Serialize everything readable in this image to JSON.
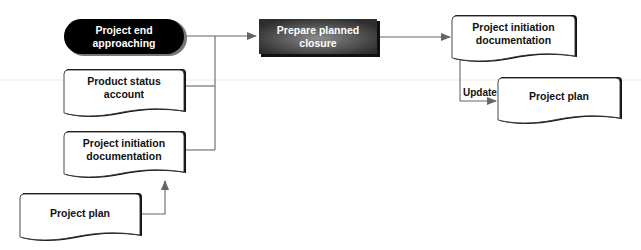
{
  "diagram": {
    "nodes": [
      {
        "id": "project-end-approaching",
        "type": "terminator",
        "label": "Project end\napproaching"
      },
      {
        "id": "product-status-account",
        "type": "document",
        "label": "Product status\naccount"
      },
      {
        "id": "project-initiation-documentation-input",
        "type": "document",
        "label": "Project initiation\ndocumentation"
      },
      {
        "id": "project-plan-input",
        "type": "document",
        "label": "Project plan"
      },
      {
        "id": "prepare-planned-closure",
        "type": "process",
        "label": "Prepare planned\nclosure"
      },
      {
        "id": "project-initiation-documentation-output",
        "type": "document",
        "label": "Project initiation\ndocumentation"
      },
      {
        "id": "project-plan-output",
        "type": "document",
        "label": "Project plan"
      }
    ],
    "edges": [
      {
        "from": "project-end-approaching",
        "to": "prepare-planned-closure",
        "label": ""
      },
      {
        "from": "product-status-account",
        "to": "prepare-planned-closure",
        "label": ""
      },
      {
        "from": "project-initiation-documentation-input",
        "to": "prepare-planned-closure",
        "label": ""
      },
      {
        "from": "project-plan-input",
        "to": "project-initiation-documentation-input",
        "label": ""
      },
      {
        "from": "prepare-planned-closure",
        "to": "project-initiation-documentation-output",
        "label": ""
      },
      {
        "from": "project-initiation-documentation-output",
        "to": "project-plan-output",
        "label": "Update"
      }
    ]
  },
  "colors": {
    "line": "#666666",
    "terminator_fill": "#000000",
    "process_fill": "#3a3a3a",
    "document_fill": "#ffffff",
    "shadow": "#111111"
  }
}
